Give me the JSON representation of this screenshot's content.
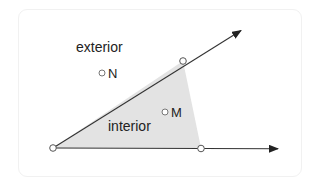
{
  "diagram": {
    "labels": {
      "exterior": "exterior",
      "interior": "interior",
      "point_n": "N",
      "point_m": "M"
    },
    "colors": {
      "fill": "#e3e3e3",
      "line": "#333333",
      "text": "#222222"
    },
    "geometry": {
      "vertex": [
        53,
        148
      ],
      "upper_ray_point": [
        183,
        61
      ],
      "upper_ray_tip": [
        241,
        30
      ],
      "lower_ray_point": [
        201,
        148
      ],
      "lower_ray_tip": [
        278,
        149
      ],
      "point_n": [
        101,
        72
      ],
      "point_m": [
        164,
        111
      ]
    }
  }
}
